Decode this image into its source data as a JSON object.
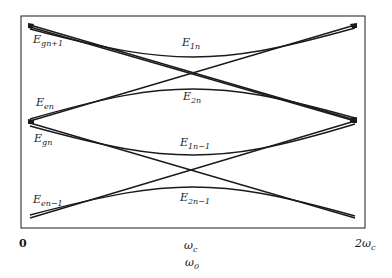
{
  "diagram": {
    "type": "energy-level avoided crossing diagram",
    "frame": {
      "left": 21,
      "top": 16,
      "right": 365,
      "bottom": 228
    },
    "line_color": "#1a1a1a",
    "curve_labels": [
      {
        "id": "E_gn+1",
        "base": "E",
        "sub": "gn+1",
        "x": 33,
        "y": 34
      },
      {
        "id": "E_en",
        "base": "E",
        "sub": "en",
        "x": 36,
        "y": 97
      },
      {
        "id": "E_gn",
        "base": "E",
        "sub": "gn",
        "x": 34,
        "y": 133
      },
      {
        "id": "E_en-1",
        "base": "E",
        "sub": "en−1",
        "x": 33,
        "y": 194
      },
      {
        "id": "E_1n",
        "base": "E",
        "sub": "1n",
        "x": 182,
        "y": 37
      },
      {
        "id": "E_2n",
        "base": "E",
        "sub": "2n",
        "x": 183,
        "y": 91
      },
      {
        "id": "E_1n-1",
        "base": "E",
        "sub": "1n−1",
        "x": 180,
        "y": 137
      },
      {
        "id": "E_2n-1",
        "base": "E",
        "sub": "2n−1",
        "x": 180,
        "y": 192
      }
    ],
    "x_ticks": [
      {
        "label": "0",
        "x": 19,
        "y": 238
      },
      {
        "label": "ω",
        "sub": "c",
        "x": 184,
        "y": 240
      },
      {
        "label": "2ω",
        "sub": "c",
        "x": 355,
        "y": 238
      }
    ],
    "x_axis_label": {
      "label": "ω",
      "sub": "0",
      "x": 185,
      "y": 257
    },
    "crossings": [
      {
        "x": 193,
        "y": 73
      },
      {
        "x": 193,
        "y": 170
      }
    ]
  }
}
